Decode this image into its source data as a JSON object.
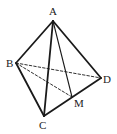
{
  "diagram": {
    "stroke_color": "#1a1a1a",
    "points": {
      "A": {
        "x": 53,
        "y": 21,
        "label": "A",
        "lx": 49,
        "ly": 15
      },
      "B": {
        "x": 16,
        "y": 63,
        "label": "B",
        "lx": 6,
        "ly": 67
      },
      "C": {
        "x": 44,
        "y": 116,
        "label": "C",
        "lx": 39,
        "ly": 129
      },
      "D": {
        "x": 101,
        "y": 78,
        "label": "D",
        "lx": 103,
        "ly": 83
      },
      "M": {
        "x": 72,
        "y": 97,
        "label": "M",
        "lx": 74,
        "ly": 107
      }
    },
    "edges": [
      {
        "from": "A",
        "to": "B",
        "style": "solid"
      },
      {
        "from": "A",
        "to": "C",
        "style": "solid"
      },
      {
        "from": "A",
        "to": "D",
        "style": "solid"
      },
      {
        "from": "B",
        "to": "C",
        "style": "solid"
      },
      {
        "from": "C",
        "to": "D",
        "style": "solid"
      },
      {
        "from": "A",
        "to": "M",
        "style": "thin"
      },
      {
        "from": "B",
        "to": "D",
        "style": "dashed"
      },
      {
        "from": "B",
        "to": "M",
        "style": "dashed"
      }
    ]
  }
}
